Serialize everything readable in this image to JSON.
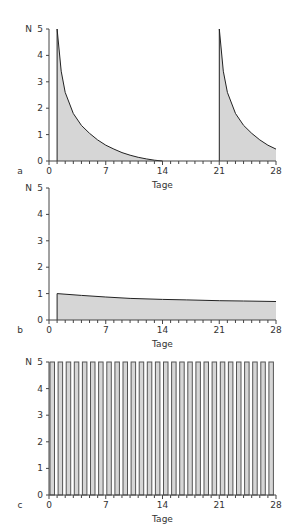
{
  "chart_data": [
    {
      "panel": "a",
      "type": "area",
      "title": "",
      "xlabel": "Tage",
      "ylabel": "N",
      "xlim": [
        0,
        28
      ],
      "ylim": [
        0,
        5
      ],
      "xticks": [
        "0",
        "7",
        "14",
        "21",
        "28"
      ],
      "yticks": [
        "0",
        "1",
        "2",
        "3",
        "4",
        "5"
      ],
      "series": [
        {
          "name": "dose 1",
          "x": [
            1,
            1.5,
            2,
            3,
            4,
            5,
            6,
            7,
            8,
            9,
            10,
            11,
            12,
            13,
            14
          ],
          "values": [
            5.0,
            3.4,
            2.6,
            1.8,
            1.35,
            1.05,
            0.8,
            0.6,
            0.45,
            0.32,
            0.22,
            0.14,
            0.08,
            0.03,
            0.0
          ]
        },
        {
          "name": "dose 2",
          "x": [
            21,
            21.5,
            22,
            23,
            24,
            25,
            26,
            27,
            28
          ],
          "values": [
            5.0,
            3.4,
            2.6,
            1.8,
            1.35,
            1.05,
            0.8,
            0.6,
            0.45
          ]
        }
      ]
    },
    {
      "panel": "b",
      "type": "area",
      "title": "",
      "xlabel": "Tage",
      "ylabel": "N",
      "xlim": [
        0,
        28
      ],
      "ylim": [
        0,
        5
      ],
      "xticks": [
        "0",
        "7",
        "14",
        "21",
        "28"
      ],
      "yticks": [
        "0",
        "1",
        "2",
        "3",
        "4",
        "5"
      ],
      "series": [
        {
          "name": "level",
          "x": [
            1,
            4,
            7,
            10,
            14,
            17,
            21,
            24,
            28
          ],
          "values": [
            1.0,
            0.93,
            0.87,
            0.82,
            0.78,
            0.76,
            0.73,
            0.72,
            0.7
          ]
        }
      ]
    },
    {
      "panel": "c",
      "type": "bar",
      "title": "",
      "xlabel": "Tage",
      "ylabel": "N",
      "xlim": [
        0,
        28
      ],
      "ylim": [
        0,
        5
      ],
      "xticks": [
        "0",
        "7",
        "14",
        "21",
        "28"
      ],
      "yticks": [
        "0",
        "1",
        "2",
        "3",
        "4",
        "5"
      ],
      "series": [
        {
          "name": "daily pulses",
          "x": [
            0,
            1,
            2,
            3,
            4,
            5,
            6,
            7,
            8,
            9,
            10,
            11,
            12,
            13,
            14,
            15,
            16,
            17,
            18,
            19,
            20,
            21,
            22,
            23,
            24,
            25,
            26,
            27,
            28
          ],
          "values": [
            5,
            5,
            5,
            5,
            5,
            5,
            5,
            5,
            5,
            5,
            5,
            5,
            5,
            5,
            5,
            5,
            5,
            5,
            5,
            5,
            5,
            5,
            5,
            5,
            5,
            5,
            5,
            5,
            5
          ]
        }
      ]
    }
  ],
  "panels": {
    "a": {
      "letter": "a",
      "xlabel": "Tage",
      "ylabel": "N"
    },
    "b": {
      "letter": "b",
      "xlabel": "Tage",
      "ylabel": "N"
    },
    "c": {
      "letter": "c",
      "xlabel": "Tage",
      "ylabel": "N"
    }
  }
}
